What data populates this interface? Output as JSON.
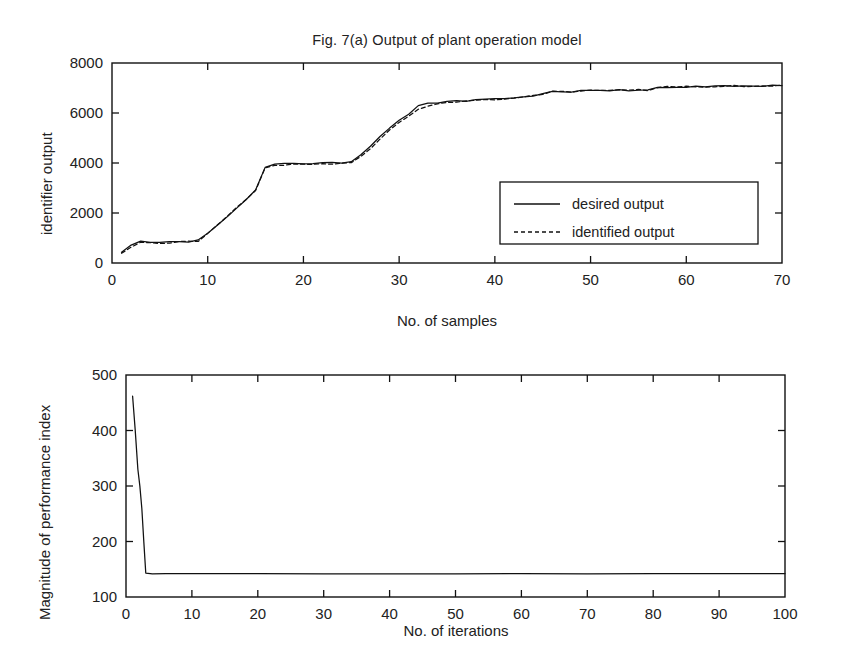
{
  "figure": {
    "title": "Fig. 7(a) Output of plant operation model"
  },
  "chart_data": [
    {
      "type": "line",
      "title": "Fig. 7(a) Output of plant operation model",
      "xlabel": "No. of samples",
      "ylabel": "identifier output",
      "xlim": [
        0,
        70
      ],
      "ylim": [
        0,
        8000
      ],
      "xticks": [
        0,
        10,
        20,
        30,
        40,
        50,
        60,
        70
      ],
      "yticks": [
        0,
        2000,
        4000,
        6000,
        8000
      ],
      "grid": false,
      "legend_position": "center-right",
      "series": [
        {
          "name": "desired output",
          "style": "solid",
          "color": "#111111",
          "x": [
            1,
            2,
            3,
            4,
            5,
            6,
            7,
            8,
            9,
            10,
            11,
            12,
            13,
            14,
            15,
            16,
            17,
            18,
            19,
            20,
            21,
            22,
            23,
            24,
            25,
            26,
            27,
            28,
            29,
            30,
            31,
            32,
            33,
            34,
            35,
            36,
            37,
            38,
            39,
            40,
            41,
            42,
            43,
            44,
            45,
            46,
            47,
            48,
            49,
            50,
            51,
            52,
            53,
            54,
            55,
            56,
            57,
            58,
            59,
            60,
            61,
            62,
            63,
            64,
            65,
            66,
            67,
            68,
            69,
            70
          ],
          "values": [
            420,
            700,
            860,
            800,
            820,
            830,
            840,
            850,
            900,
            1180,
            1500,
            1850,
            2200,
            2550,
            2900,
            3850,
            3950,
            3960,
            3970,
            3980,
            3985,
            3990,
            3995,
            4000,
            4020,
            4350,
            4700,
            5050,
            5400,
            5700,
            5950,
            6300,
            6380,
            6420,
            6450,
            6470,
            6490,
            6510,
            6530,
            6550,
            6580,
            6620,
            6660,
            6700,
            6780,
            6850,
            6860,
            6870,
            6880,
            6890,
            6895,
            6900,
            6905,
            6910,
            6915,
            6920,
            7020,
            7040,
            7050,
            7055,
            7060,
            7065,
            7070,
            7075,
            7080,
            7085,
            7090,
            7090,
            7095,
            7100
          ]
        },
        {
          "name": "identified output",
          "style": "dashed",
          "color": "#111111",
          "x": [
            1,
            2,
            3,
            4,
            5,
            6,
            7,
            8,
            9,
            10,
            11,
            12,
            13,
            14,
            15,
            16,
            17,
            18,
            19,
            20,
            21,
            22,
            23,
            24,
            25,
            26,
            27,
            28,
            29,
            30,
            31,
            32,
            33,
            34,
            35,
            36,
            37,
            38,
            39,
            40,
            41,
            42,
            43,
            44,
            45,
            46,
            47,
            48,
            49,
            50,
            51,
            52,
            53,
            54,
            55,
            56,
            57,
            58,
            59,
            60,
            61,
            62,
            63,
            64,
            65,
            66,
            67,
            68,
            69,
            70
          ],
          "values": [
            380,
            660,
            830,
            790,
            810,
            825,
            835,
            845,
            890,
            1200,
            1520,
            1870,
            2210,
            2560,
            2930,
            3800,
            3900,
            3930,
            3950,
            3960,
            3970,
            3975,
            3980,
            3990,
            4010,
            4280,
            4600,
            4950,
            5320,
            5650,
            5900,
            6150,
            6280,
            6360,
            6410,
            6440,
            6470,
            6495,
            6520,
            6545,
            6575,
            6615,
            6655,
            6695,
            6770,
            6840,
            6855,
            6865,
            6875,
            6885,
            6890,
            6895,
            6900,
            6905,
            6912,
            6918,
            7010,
            7035,
            7048,
            7053,
            7058,
            7063,
            7068,
            7073,
            7078,
            7083,
            7088,
            7088,
            7093,
            7098
          ]
        }
      ]
    },
    {
      "type": "line",
      "title": "",
      "xlabel": "No. of iterations",
      "ylabel": "Magnitude of performance index",
      "xlim": [
        0,
        100
      ],
      "ylim": [
        100,
        500
      ],
      "xticks": [
        0,
        10,
        20,
        30,
        40,
        50,
        60,
        70,
        80,
        90,
        100
      ],
      "yticks": [
        100,
        200,
        300,
        400,
        500
      ],
      "grid": false,
      "legend_position": "none",
      "series": [
        {
          "name": "performance index",
          "style": "solid",
          "color": "#111111",
          "x": [
            1,
            1.4,
            1.8,
            2.1,
            2.4,
            2.7,
            3,
            4,
            6,
            10,
            20,
            30,
            40,
            50,
            60,
            70,
            80,
            90,
            100
          ],
          "values": [
            462,
            400,
            330,
            300,
            260,
            200,
            143,
            142,
            142,
            142,
            142,
            142,
            142,
            142,
            142,
            142,
            142,
            142,
            142
          ]
        }
      ]
    }
  ],
  "top_chart": {
    "title": "Fig. 7(a) Output of plant operation model",
    "xlabel": "No. of samples",
    "ylabel": "identifier output",
    "xticks": [
      "0",
      "10",
      "20",
      "30",
      "40",
      "50",
      "60",
      "70"
    ],
    "yticks": [
      "8000",
      "6000",
      "4000",
      "2000",
      "0"
    ],
    "legend": [
      {
        "label": "desired output",
        "style": "solid"
      },
      {
        "label": "identified output",
        "style": "dashed"
      }
    ]
  },
  "bottom_chart": {
    "xlabel": "No. of iterations",
    "ylabel": "Magnitude of performance index",
    "xticks": [
      "0",
      "10",
      "20",
      "30",
      "40",
      "50",
      "60",
      "70",
      "80",
      "90",
      "100"
    ],
    "yticks": [
      "500",
      "400",
      "300",
      "200",
      "100"
    ]
  },
  "colors": {
    "axis": "#111111",
    "curve": "#111111",
    "background": "#ffffff"
  }
}
